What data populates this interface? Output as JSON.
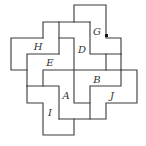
{
  "diagram": {
    "type": "jigsaw-pieces",
    "pieces": [
      {
        "label": "G",
        "x": 97,
        "y": 32
      },
      {
        "label": "H",
        "x": 38,
        "y": 47
      },
      {
        "label": "D",
        "x": 82,
        "y": 50
      },
      {
        "label": "E",
        "x": 50,
        "y": 63
      },
      {
        "label": "B",
        "x": 97,
        "y": 80
      },
      {
        "label": "A",
        "x": 66,
        "y": 96
      },
      {
        "label": "J",
        "x": 112,
        "y": 96
      },
      {
        "label": "I",
        "x": 50,
        "y": 113
      }
    ],
    "marker": {
      "x": 105,
      "y": 34,
      "color": "#111111"
    }
  }
}
